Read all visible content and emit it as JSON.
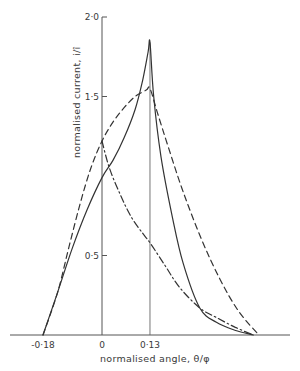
{
  "chart_data": {
    "type": "line",
    "title": "",
    "xlabel": "normalised angle, θ/φ",
    "ylabel": "normalised current, i/î",
    "xlim": [
      -0.25,
      0.52
    ],
    "ylim": [
      0,
      2.0
    ],
    "grid": false,
    "legend": null,
    "x_ticks": [
      {
        "value": -0.18,
        "label": "-0·18"
      },
      {
        "value": 0,
        "label": "0"
      },
      {
        "value": 0.13,
        "label": "0·13"
      }
    ],
    "y_ticks": [
      {
        "value": 0.5,
        "label": "0·5"
      },
      {
        "value": 1.5,
        "label": "1·5"
      },
      {
        "value": 2.0,
        "label": "2·0"
      }
    ],
    "vertical_guides": [
      0,
      0.13
    ],
    "series": [
      {
        "name": "solid",
        "style": "solid",
        "x": [
          -0.16,
          -0.12,
          -0.08,
          -0.04,
          0.0,
          0.03,
          0.06,
          0.09,
          0.11,
          0.125,
          0.13,
          0.14,
          0.16,
          0.19,
          0.22,
          0.265,
          0.31,
          0.36,
          0.41
        ],
        "y": [
          0.0,
          0.27,
          0.55,
          0.79,
          0.99,
          1.1,
          1.24,
          1.42,
          1.6,
          1.78,
          1.84,
          1.5,
          1.12,
          0.75,
          0.45,
          0.17,
          0.08,
          0.03,
          0.0
        ]
      },
      {
        "name": "dashed",
        "style": "dashed",
        "x": [
          -0.16,
          -0.12,
          -0.09,
          -0.06,
          -0.03,
          0.0,
          0.03,
          0.06,
          0.09,
          0.12,
          0.13,
          0.15,
          0.18,
          0.22,
          0.27,
          0.32,
          0.37,
          0.425
        ],
        "y": [
          0.0,
          0.27,
          0.55,
          0.82,
          1.05,
          1.22,
          1.34,
          1.43,
          1.5,
          1.54,
          1.55,
          1.4,
          1.18,
          0.9,
          0.6,
          0.35,
          0.15,
          0.0
        ]
      },
      {
        "name": "dash-dot",
        "style": "dashdot",
        "x": [
          0.0,
          0.02,
          0.05,
          0.08,
          0.11,
          0.13,
          0.17,
          0.21,
          0.265,
          0.31,
          0.36,
          0.41
        ],
        "y": [
          1.22,
          1.05,
          0.88,
          0.74,
          0.64,
          0.58,
          0.44,
          0.3,
          0.17,
          0.11,
          0.05,
          0.0
        ]
      }
    ]
  },
  "layout": {
    "origin_px": {
      "x": 102,
      "y": 335
    },
    "x_px_per_unit": 369,
    "y_px_per_unit": 159,
    "x_axis_px": [
      10,
      290
    ],
    "y_axis_top_px": 17
  }
}
